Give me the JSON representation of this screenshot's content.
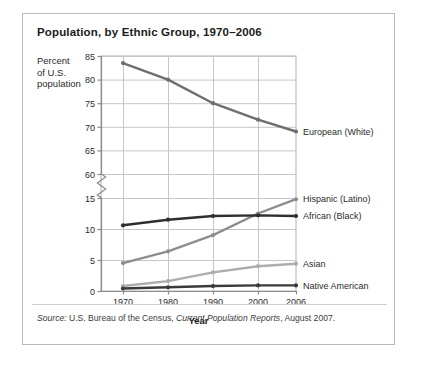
{
  "figure": {
    "title": "Population, by Ethnic Group, 1970–2006",
    "y_caption": "Percent\nof U.S.\npopulation",
    "y_caption_lines": [
      "Percent",
      "of U.S.",
      "population"
    ],
    "source_prefix": "Source:",
    "source_text_a": " U.S. Bureau of the Census, ",
    "source_italic": "Current Population Reports",
    "source_text_b": ", August 2007."
  },
  "chart_data": {
    "type": "line",
    "title": "Population, by Ethnic Group, 1970–2006",
    "xlabel": "Year",
    "ylabel": "Percent of U.S. population",
    "x": [
      1970,
      1980,
      1990,
      2000,
      2006
    ],
    "xtick_labels": [
      "1970",
      "1980",
      "1990",
      "2000",
      "2006"
    ],
    "ytick_labels_upper": [
      "85",
      "80",
      "75",
      "70",
      "65",
      "60"
    ],
    "ytick_values_upper": [
      85,
      80,
      75,
      70,
      65,
      60
    ],
    "ytick_labels_lower": [
      "15",
      "10",
      "5",
      "0"
    ],
    "ytick_values_lower": [
      15,
      10,
      5,
      0
    ],
    "axis_break": true,
    "axis_break_between": [
      15,
      60
    ],
    "grid": true,
    "legend_position": "right-of-plot-at-line-end",
    "series": [
      {
        "name": "European (White)",
        "label": "European (White)",
        "color": "#6e6e6e",
        "values": [
          83.5,
          80.0,
          75.0,
          71.5,
          69.0
        ]
      },
      {
        "name": "Hispanic (Latino)",
        "label": "Hispanic (Latino)",
        "color": "#8d8d8d",
        "values": [
          4.5,
          6.4,
          9.0,
          12.5,
          14.8
        ]
      },
      {
        "name": "African (Black)",
        "label": "African (Black)",
        "color": "#2f2f2f",
        "values": [
          10.6,
          11.5,
          12.1,
          12.2,
          12.1
        ]
      },
      {
        "name": "Asian",
        "label": "Asian",
        "color": "#adadad",
        "values": [
          0.8,
          1.6,
          3.0,
          4.0,
          4.4
        ]
      },
      {
        "name": "Native American",
        "label": "Native American",
        "color": "#3a3a3a",
        "values": [
          0.4,
          0.6,
          0.8,
          0.9,
          0.9
        ]
      }
    ]
  }
}
